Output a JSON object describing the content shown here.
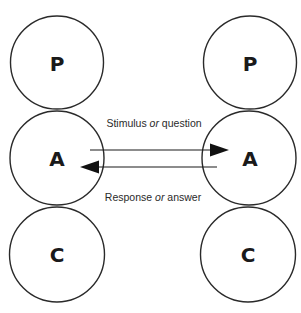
{
  "diagram": {
    "type": "transactional-analysis",
    "colors": {
      "stroke": "#2a2a2a",
      "text": "#1a1a1a",
      "background": "#ffffff"
    },
    "left_person": {
      "states": [
        {
          "id": "P",
          "label": "P"
        },
        {
          "id": "A",
          "label": "A"
        },
        {
          "id": "C",
          "label": "C"
        }
      ]
    },
    "right_person": {
      "states": [
        {
          "id": "P",
          "label": "P"
        },
        {
          "id": "A",
          "label": "A"
        },
        {
          "id": "C",
          "label": "C"
        }
      ]
    },
    "transactions": [
      {
        "from": "left.A",
        "to": "right.A",
        "label_start": "Stimulus ",
        "label_conj": "or",
        "label_end": " question"
      },
      {
        "from": "right.A",
        "to": "left.A",
        "label_start": "Response ",
        "label_conj": "or",
        "label_end": " answer"
      }
    ]
  }
}
